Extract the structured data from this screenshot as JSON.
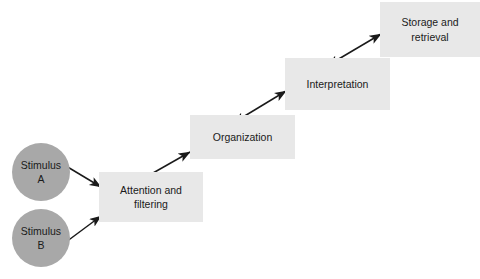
{
  "diagram": {
    "type": "flow-diagram",
    "colors": {
      "box_fill": "#e8e8e8",
      "circle_fill": "#a8a8a8",
      "arrow": "#1a1a1a",
      "text": "#1a1a1a",
      "background": "#ffffff"
    },
    "inputs": [
      {
        "id": "stimulus-a",
        "label": "Stimulus\nA",
        "shape": "circle",
        "cx": 41,
        "cy": 172,
        "r": 29
      },
      {
        "id": "stimulus-b",
        "label": "Stimulus\nB",
        "shape": "circle",
        "cx": 41,
        "cy": 238,
        "r": 29
      }
    ],
    "stages": [
      {
        "id": "attention-and-filtering",
        "label": "Attention  and\nfiltering",
        "shape": "rect",
        "x": 99,
        "y": 172,
        "w": 104,
        "h": 50
      },
      {
        "id": "organization",
        "label": "Organization",
        "shape": "rect",
        "x": 190,
        "y": 115,
        "w": 105,
        "h": 44
      },
      {
        "id": "interpretation",
        "label": "Interpretation",
        "shape": "rect",
        "x": 285,
        "y": 58,
        "w": 105,
        "h": 52
      },
      {
        "id": "storage-and-retrieval",
        "label": "Storage and\nretrieval",
        "shape": "rect",
        "x": 380,
        "y": 2,
        "w": 100,
        "h": 55
      }
    ],
    "connectors": [
      {
        "id": "stimulus-a-to-attention",
        "from": "stimulus-a",
        "to": "attention-and-filtering",
        "heads": "single",
        "x1": 66,
        "y1": 166,
        "x2": 101,
        "y2": 187
      },
      {
        "id": "stimulus-b-to-attention",
        "from": "stimulus-b",
        "to": "attention-and-filtering",
        "heads": "single",
        "x1": 66,
        "y1": 242,
        "x2": 101,
        "y2": 216
      },
      {
        "id": "attention-to-organization",
        "from": "attention-and-filtering",
        "to": "organization",
        "heads": "double",
        "x1": 146,
        "y1": 177,
        "x2": 190,
        "y2": 152
      },
      {
        "id": "organization-to-interpretation",
        "from": "organization",
        "to": "interpretation",
        "heads": "double",
        "x1": 243,
        "y1": 117,
        "x2": 286,
        "y2": 91
      },
      {
        "id": "interpretation-to-storage",
        "from": "interpretation",
        "to": "storage-and-retrieval",
        "heads": "double",
        "x1": 337,
        "y1": 60,
        "x2": 381,
        "y2": 34
      }
    ]
  }
}
